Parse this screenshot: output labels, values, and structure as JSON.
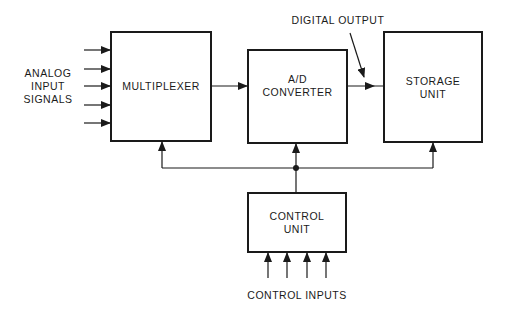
{
  "diagram": {
    "type": "block-diagram",
    "blocks": {
      "multiplexer": {
        "label": "MULTIPLEXER"
      },
      "ad_converter": {
        "line1": "A/D",
        "line2": "CONVERTER"
      },
      "storage_unit": {
        "line1": "STORAGE",
        "line2": "UNIT"
      },
      "control_unit": {
        "line1": "CONTROL",
        "line2": "UNIT"
      }
    },
    "labels": {
      "analog_line1": "ANALOG",
      "analog_line2": "INPUT",
      "analog_line3": "SIGNALS",
      "digital_output": "DIGITAL OUTPUT",
      "control_inputs": "CONTROL INPUTS"
    },
    "analog_input_count": 5,
    "control_input_count": 4,
    "connections": [
      {
        "from": "analog inputs",
        "to": "multiplexer"
      },
      {
        "from": "multiplexer",
        "to": "ad_converter"
      },
      {
        "from": "ad_converter",
        "to": "storage_unit",
        "label": "DIGITAL OUTPUT"
      },
      {
        "from": "control_unit",
        "to": "multiplexer"
      },
      {
        "from": "control_unit",
        "to": "ad_converter"
      },
      {
        "from": "control_unit",
        "to": "storage_unit"
      },
      {
        "from": "control inputs",
        "to": "control_unit"
      }
    ],
    "colors": {
      "stroke": "#1a1a1a",
      "background": "#ffffff"
    }
  }
}
